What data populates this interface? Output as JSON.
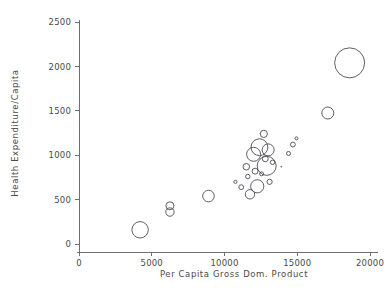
{
  "chart_data": {
    "type": "scatter",
    "title": "",
    "xlabel": "Per Capita Gross Dom. Product",
    "ylabel": "Health Expenditure/Capita",
    "xlim": [
      0,
      20600
    ],
    "ylim": [
      0,
      2600
    ],
    "xticks": [
      0,
      5000,
      10000,
      15000,
      20000
    ],
    "xtick_labels": [
      "0",
      "5000",
      "10000",
      "15000",
      "20000"
    ],
    "yticks": [
      0,
      500,
      1000,
      1500,
      2000,
      2500
    ],
    "ytick_labels": [
      "0",
      "500",
      "1000",
      "1500",
      "2000",
      "2500"
    ],
    "grid": false,
    "legend": false,
    "marker": "open-circle",
    "size_encoding": "bubble radius encodes a third variable (e.g. population)",
    "points": [
      {
        "x": 4200,
        "y": 160,
        "r": 8.2
      },
      {
        "x": 6250,
        "y": 430,
        "r": 4.0
      },
      {
        "x": 6250,
        "y": 360,
        "r": 4.2
      },
      {
        "x": 8900,
        "y": 540,
        "r": 5.8
      },
      {
        "x": 10750,
        "y": 700,
        "r": 1.6
      },
      {
        "x": 11150,
        "y": 640,
        "r": 2.4
      },
      {
        "x": 11500,
        "y": 870,
        "r": 3.3
      },
      {
        "x": 11600,
        "y": 760,
        "r": 2.2
      },
      {
        "x": 11750,
        "y": 560,
        "r": 4.7
      },
      {
        "x": 12000,
        "y": 1010,
        "r": 7.0
      },
      {
        "x": 12100,
        "y": 820,
        "r": 3.0
      },
      {
        "x": 12250,
        "y": 650,
        "r": 6.6
      },
      {
        "x": 12400,
        "y": 1090,
        "r": 8.4
      },
      {
        "x": 12550,
        "y": 790,
        "r": 2.0
      },
      {
        "x": 12700,
        "y": 1240,
        "r": 3.6
      },
      {
        "x": 12800,
        "y": 960,
        "r": 3.0
      },
      {
        "x": 12900,
        "y": 880,
        "r": 9.5
      },
      {
        "x": 13000,
        "y": 1060,
        "r": 6.0
      },
      {
        "x": 13100,
        "y": 700,
        "r": 2.6
      },
      {
        "x": 13300,
        "y": 920,
        "r": 2.2
      },
      {
        "x": 13900,
        "y": 870,
        "r": 0.9
      },
      {
        "x": 14400,
        "y": 1020,
        "r": 2.0
      },
      {
        "x": 14700,
        "y": 1120,
        "r": 2.4
      },
      {
        "x": 14950,
        "y": 1190,
        "r": 1.5
      },
      {
        "x": 17100,
        "y": 1475,
        "r": 6.0
      },
      {
        "x": 18600,
        "y": 2040,
        "r": 15.0
      }
    ]
  }
}
